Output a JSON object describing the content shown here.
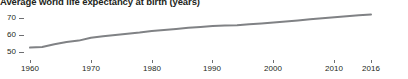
{
  "chart_data": {
    "type": "line",
    "title": "Average world life expectancy at birth (years)",
    "xlabel": "",
    "ylabel": "",
    "xlim": [
      1960,
      2016
    ],
    "ylim": [
      47,
      73
    ],
    "yticks": [
      50,
      60,
      70
    ],
    "ytick_labels": [
      "50",
      "60",
      "70"
    ],
    "xticks": [
      1960,
      1970,
      1980,
      1990,
      2000,
      2010,
      2016
    ],
    "xtick_labels": [
      "1960",
      "1970",
      "1980",
      "1990",
      "2000",
      "2010",
      "2016"
    ],
    "grid": false,
    "legend": null,
    "line_color": "#808285",
    "series": [
      {
        "name": "World life expectancy at birth",
        "x": [
          1960,
          1962,
          1964,
          1966,
          1968,
          1970,
          1972,
          1974,
          1976,
          1978,
          1980,
          1982,
          1984,
          1986,
          1988,
          1990,
          1992,
          1994,
          1996,
          1998,
          2000,
          2002,
          2004,
          2006,
          2008,
          2010,
          2012,
          2014,
          2016
        ],
        "values": [
          52.6,
          53.0,
          54.6,
          55.9,
          56.7,
          58.4,
          59.2,
          60.0,
          60.8,
          61.5,
          62.4,
          63.0,
          63.6,
          64.2,
          64.7,
          65.3,
          65.6,
          65.8,
          66.3,
          66.8,
          67.4,
          68.0,
          68.6,
          69.2,
          69.8,
          70.4,
          71.1,
          71.6,
          72.0
        ]
      }
    ]
  },
  "axis": {
    "y_labels": [
      "70",
      "60",
      "50"
    ],
    "x_labels": [
      "1960",
      "1970",
      "1980",
      "1990",
      "2000",
      "2010",
      "2016"
    ]
  }
}
